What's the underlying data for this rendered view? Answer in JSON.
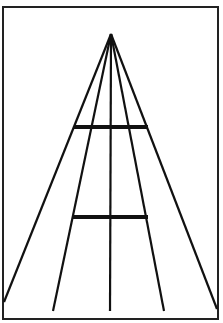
{
  "figure": {
    "frame": {
      "x": 3,
      "y": 7,
      "width": 215,
      "height": 312,
      "color": "#222222"
    },
    "apex": {
      "x": 111,
      "y": 34
    },
    "rays": [
      {
        "x2": 4,
        "y2": 302
      },
      {
        "x2": 53,
        "y2": 311
      },
      {
        "x2": 110,
        "y2": 311
      },
      {
        "x2": 164,
        "y2": 311
      },
      {
        "x2": 217,
        "y2": 309
      }
    ],
    "bars": [
      {
        "x1": 74,
        "x2": 148,
        "y": 127
      },
      {
        "x1": 73,
        "x2": 148,
        "y": 217
      }
    ],
    "line_color": "#111111"
  }
}
